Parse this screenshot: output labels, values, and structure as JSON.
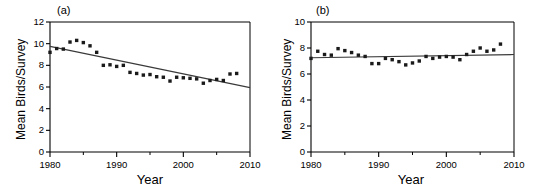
{
  "figure": {
    "title": "",
    "background": "#ffffff",
    "marker_color": "#1a1a1a",
    "line_color": "#3a3a3a",
    "axis_color": "#000000"
  },
  "chart_data": [
    {
      "type": "scatter",
      "panel": "a",
      "panel_label": "(a)",
      "title": "",
      "xlabel": "Year",
      "ylabel": "Mean Birds/Survey",
      "xlim": [
        1980,
        2010
      ],
      "ylim": [
        0,
        12
      ],
      "xticks": [
        1980,
        1990,
        2000,
        2010
      ],
      "xtick_labels": [
        "1980",
        "1990",
        "2000",
        "2010"
      ],
      "xminor_ticks": [
        1985,
        1995,
        2005
      ],
      "yticks": [
        0,
        2,
        4,
        6,
        8,
        10,
        12
      ],
      "ytick_labels": [
        "0",
        "2",
        "4",
        "6",
        "8",
        "10",
        "12"
      ],
      "grid": false,
      "legend": "none",
      "x": [
        1980,
        1981,
        1982,
        1983,
        1984,
        1985,
        1986,
        1987,
        1988,
        1989,
        1990,
        1991,
        1992,
        1993,
        1994,
        1995,
        1996,
        1997,
        1998,
        1999,
        2000,
        2001,
        2002,
        2003,
        2004,
        2005,
        2006,
        2007,
        2008
      ],
      "y": [
        9.2,
        9.55,
        9.5,
        10.15,
        10.3,
        10.1,
        9.8,
        9.2,
        8.0,
        8.05,
        7.9,
        8.0,
        7.35,
        7.25,
        7.1,
        7.15,
        6.95,
        6.9,
        6.55,
        6.9,
        6.85,
        6.8,
        6.75,
        6.35,
        6.6,
        6.7,
        6.6,
        7.2,
        7.25
      ],
      "trendline": {
        "x": [
          1980,
          2010
        ],
        "y": [
          9.75,
          5.95
        ],
        "style": "solid"
      },
      "annotations": []
    },
    {
      "type": "scatter",
      "panel": "b",
      "panel_label": "(b)",
      "title": "",
      "xlabel": "Year",
      "ylabel": "Mean Birds/Survey",
      "xlim": [
        1980,
        2010
      ],
      "ylim": [
        0,
        10
      ],
      "xticks": [
        1980,
        1990,
        2000,
        2010
      ],
      "xtick_labels": [
        "1980",
        "1990",
        "2000",
        "2010"
      ],
      "xminor_ticks": [
        1985,
        1995,
        2005
      ],
      "yticks": [
        0,
        2,
        4,
        6,
        8,
        10
      ],
      "ytick_labels": [
        "0",
        "2",
        "4",
        "6",
        "8",
        "10"
      ],
      "grid": false,
      "legend": "none",
      "x": [
        1980,
        1981,
        1982,
        1983,
        1984,
        1985,
        1986,
        1987,
        1988,
        1989,
        1990,
        1991,
        1992,
        1993,
        1994,
        1995,
        1996,
        1997,
        1998,
        1999,
        2000,
        2001,
        2002,
        2003,
        2004,
        2005,
        2006,
        2007,
        2008
      ],
      "y": [
        7.2,
        7.75,
        7.5,
        7.45,
        7.95,
        7.8,
        7.65,
        7.45,
        7.35,
        6.8,
        6.8,
        7.2,
        7.1,
        6.95,
        6.7,
        6.85,
        7.0,
        7.35,
        7.2,
        7.3,
        7.35,
        7.3,
        7.1,
        7.5,
        7.75,
        8.0,
        7.75,
        7.85,
        8.3
      ],
      "trendline": {
        "x": [
          1980,
          2010
        ],
        "y": [
          7.25,
          7.5
        ],
        "style": "solid"
      },
      "annotations": []
    }
  ]
}
